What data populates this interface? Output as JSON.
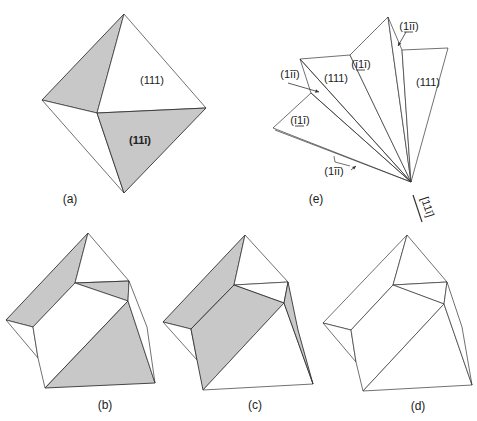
{
  "figure": {
    "colors": {
      "stroke": "#333333",
      "shade": "#c8c8c8",
      "background": "#ffffff",
      "text": "#222222"
    },
    "panels": [
      {
        "id": "a",
        "label": "(a)",
        "label_pos": [
          70,
          203
        ],
        "polygons": [
          {
            "points": [
              [
                124,
                14
              ],
              [
                42,
                100
              ],
              [
                97,
                113
              ]
            ],
            "shaded": true
          },
          {
            "points": [
              [
                124,
                14
              ],
              [
                97,
                113
              ],
              [
                206,
                108
              ]
            ],
            "shaded": false
          },
          {
            "points": [
              [
                42,
                100
              ],
              [
                97,
                113
              ],
              [
                124,
                193
              ]
            ],
            "shaded": false
          },
          {
            "points": [
              [
                97,
                113
              ],
              [
                206,
                108
              ],
              [
                124,
                193
              ]
            ],
            "shaded": true
          }
        ],
        "face_labels": [
          {
            "text": "(111)",
            "pos": [
              152,
              84
            ],
            "bold": false
          },
          {
            "text": "(11ī)",
            "pos": [
              140,
              144
            ],
            "bold": true
          }
        ]
      },
      {
        "id": "b",
        "label": "(b)",
        "label_pos": [
          105,
          409
        ],
        "polygons": [
          {
            "points": [
              [
                88,
                233
              ],
              [
                6,
                320
              ],
              [
                33,
                327
              ],
              [
                75,
                283
              ]
            ],
            "shaded": true
          },
          {
            "points": [
              [
                88,
                233
              ],
              [
                75,
                283
              ],
              [
                129,
                281
              ]
            ],
            "shaded": false
          },
          {
            "points": [
              [
                75,
                283
              ],
              [
                129,
                281
              ],
              [
                128,
                301
              ]
            ],
            "shaded": true
          },
          {
            "points": [
              [
                6,
                320
              ],
              [
                33,
                327
              ],
              [
                38,
                358
              ]
            ],
            "shaded": false
          },
          {
            "points": [
              [
                33,
                327
              ],
              [
                75,
                283
              ],
              [
                128,
                301
              ],
              [
                45,
                388
              ],
              [
                38,
                358
              ]
            ],
            "shaded": false
          },
          {
            "points": [
              [
                128,
                301
              ],
              [
                155,
                383
              ],
              [
                45,
                388
              ]
            ],
            "shaded": true
          },
          {
            "points": [
              [
                129,
                281
              ],
              [
                147,
                327
              ],
              [
                155,
                383
              ],
              [
                128,
                301
              ]
            ],
            "shaded": false
          }
        ]
      },
      {
        "id": "c",
        "label": "(c)",
        "label_pos": [
          255,
          409
        ],
        "polygons": [
          {
            "points": [
              [
                245,
                235
              ],
              [
                163,
                322
              ],
              [
                191,
                329
              ],
              [
                234,
                285
              ]
            ],
            "shaded": true
          },
          {
            "points": [
              [
                245,
                235
              ],
              [
                234,
                285
              ],
              [
                288,
                282
              ]
            ],
            "shaded": false
          },
          {
            "points": [
              [
                234,
                285
              ],
              [
                288,
                282
              ],
              [
                284,
                303
              ]
            ],
            "shaded": false
          },
          {
            "points": [
              [
                163,
                322
              ],
              [
                191,
                329
              ],
              [
                197,
                360
              ]
            ],
            "shaded": false
          },
          {
            "points": [
              [
                191,
                329
              ],
              [
                234,
                285
              ],
              [
                284,
                303
              ],
              [
                203,
                390
              ],
              [
                197,
                360
              ]
            ],
            "shaded": true
          },
          {
            "points": [
              [
                284,
                303
              ],
              [
                313,
                384
              ],
              [
                203,
                390
              ]
            ],
            "shaded": false
          },
          {
            "points": [
              [
                288,
                282
              ],
              [
                298,
                330
              ],
              [
                313,
                384
              ],
              [
                284,
                303
              ]
            ],
            "shaded": true
          }
        ]
      },
      {
        "id": "d",
        "label": "(d)",
        "label_pos": [
          418,
          410
        ],
        "polygons": [
          {
            "points": [
              [
                407,
                235
              ],
              [
                323,
                323
              ],
              [
                351,
                330
              ],
              [
                393,
                285
              ]
            ],
            "shaded": false
          },
          {
            "points": [
              [
                407,
                235
              ],
              [
                393,
                285
              ],
              [
                447,
                282
              ]
            ],
            "shaded": false
          },
          {
            "points": [
              [
                393,
                285
              ],
              [
                447,
                282
              ],
              [
                444,
                304
              ]
            ],
            "shaded": false
          },
          {
            "points": [
              [
                323,
                323
              ],
              [
                351,
                330
              ],
              [
                356,
                362
              ]
            ],
            "shaded": false
          },
          {
            "points": [
              [
                351,
                330
              ],
              [
                393,
                285
              ],
              [
                444,
                304
              ],
              [
                363,
                391
              ],
              [
                356,
                362
              ]
            ],
            "shaded": false
          },
          {
            "points": [
              [
                444,
                304
              ],
              [
                472,
                385
              ],
              [
                363,
                391
              ]
            ],
            "shaded": false
          },
          {
            "points": [
              [
                447,
                282
              ],
              [
                462,
                327
              ],
              [
                472,
                385
              ],
              [
                444,
                304
              ]
            ],
            "shaded": false
          }
        ]
      },
      {
        "id": "e",
        "label": "(e)",
        "label_pos": [
          316,
          203
        ],
        "apex": [
          411,
          182
        ],
        "polygons": [
          {
            "points": [
              [
                411,
                182
              ],
              [
                273,
                128
              ],
              [
                311,
                93
              ]
            ],
            "shaded": false
          },
          {
            "points": [
              [
                411,
                182
              ],
              [
                300,
                59
              ],
              [
                350,
                55
              ]
            ],
            "shaded": false
          },
          {
            "points": [
              [
                411,
                182
              ],
              [
                350,
                55
              ],
              [
                388,
                17
              ]
            ],
            "shaded": false
          },
          {
            "points": [
              [
                411,
                182
              ],
              [
                388,
                17
              ],
              [
                402,
                50
              ]
            ],
            "shaded": false
          },
          {
            "points": [
              [
                411,
                182
              ],
              [
                402,
                50
              ],
              [
                448,
                48
              ]
            ],
            "shaded": false
          }
        ],
        "extra_lines": [
          [
            [
              411,
              182
            ],
            [
              311,
              93
            ]
          ],
          [
            [
              411,
              182
            ],
            [
              300,
              59
            ]
          ],
          [
            [
              411,
              182
            ],
            [
              275,
              130
            ]
          ],
          [
            [
              311,
              93
            ],
            [
              300,
              59
            ]
          ]
        ],
        "face_labels": [
          {
            "text": "(ī1ī)",
            "pos": [
              300,
              124
            ],
            "underline_mid": true
          },
          {
            "text": "(1īī)",
            "pos": [
              290,
              78
            ],
            "underline_mid": false
          },
          {
            "text": "(111)",
            "pos": [
              336,
              82
            ],
            "underline_mid": false
          },
          {
            "text": "(ī1ī)",
            "pos": [
              361,
              68
            ],
            "underline_mid": true
          },
          {
            "text": "(1īī)",
            "pos": [
              409,
              30
            ],
            "underline_mid": true
          },
          {
            "text": "(111)",
            "pos": [
              428,
              86
            ],
            "underline_mid": false
          },
          {
            "text": "(1īī)",
            "pos": [
              334,
              175
            ],
            "underline_mid": false
          }
        ],
        "arrows": [
          {
            "from": [
              288,
              83
            ],
            "to": [
              319,
              92
            ]
          },
          {
            "from": [
              406,
              32
            ],
            "to": [
              398,
              46
            ]
          },
          {
            "from": [
              351,
              170
            ],
            "to": [
              356,
              166
            ]
          }
        ],
        "angle_marks": [
          {
            "points": [
              [
                334,
                156
              ],
              [
                335,
                162
              ],
              [
                350,
                166
              ]
            ]
          }
        ],
        "axis_label": {
          "text": "[11ī]",
          "pos": [
            424,
            208
          ],
          "rotate": 72
        },
        "axis_line": [
          [
            413,
            195
          ],
          [
            422,
            222
          ]
        ]
      }
    ]
  }
}
